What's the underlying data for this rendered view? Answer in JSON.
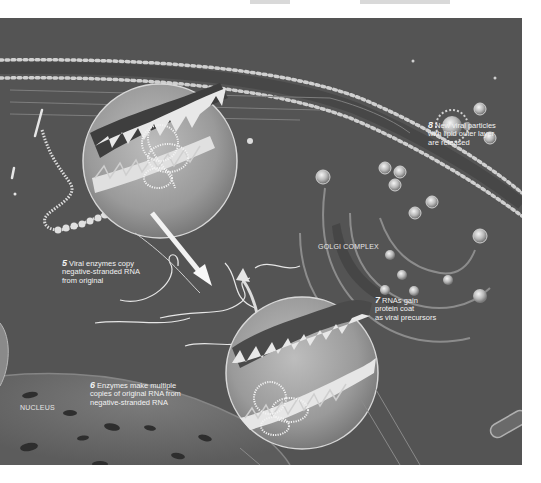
{
  "figure": {
    "background_color": "#545454",
    "accent_color": "#f2f2f2",
    "steps": [
      {
        "number": "5",
        "text": "Viral enzymes copy\nnegative-stranded RNA\nfrom original"
      },
      {
        "number": "6",
        "text": "Enzymes make multiple\ncopies of original RNA from\nnegative-stranded RNA"
      },
      {
        "number": "7",
        "text": "RNAs gain\nprotein coat\nas viral precursors"
      },
      {
        "number": "8",
        "text": "New viral particles\nwith lipid outer layer\nare released"
      }
    ],
    "structure_labels": {
      "golgi": "GOLGI COMPLEX",
      "nucleus": "NUCLEUS"
    },
    "icons": {
      "magnifier_top": "magnified-rna-copy-icon",
      "magnifier_bottom": "magnified-rna-multiply-icon",
      "arrow_down": "arrow-down-icon",
      "arrow_up": "arrow-up-icon",
      "virus_particle": "virus-particle-icon"
    }
  }
}
